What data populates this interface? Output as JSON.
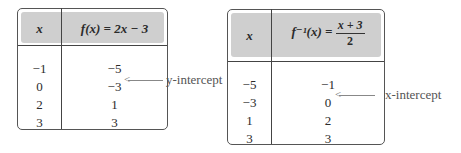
{
  "left_table": {
    "header": {
      "x": "x",
      "fx": "f(x) = 2x − 3"
    },
    "rows": [
      {
        "x": "−1",
        "fx": "−5"
      },
      {
        "x": "0",
        "fx": "−3"
      },
      {
        "x": "2",
        "fx": "1"
      },
      {
        "x": "3",
        "fx": "3"
      }
    ],
    "annotation": "y-intercept"
  },
  "right_table": {
    "header": {
      "x": "x",
      "finv_prefix": "f⁻¹(x) =",
      "numerator": "x + 3",
      "denominator": "2"
    },
    "rows": [
      {
        "x": "−5",
        "fx": "−1"
      },
      {
        "x": "−3",
        "fx": "0"
      },
      {
        "x": "1",
        "fx": "2"
      },
      {
        "x": "3",
        "fx": "3"
      }
    ],
    "annotation": "x-intercept"
  }
}
